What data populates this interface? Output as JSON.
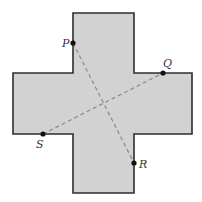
{
  "diagram": {
    "shape": "cross",
    "colors": {
      "fill": "#d2d2d2",
      "stroke": "#2e2e2e",
      "dash": "#8a8a8a",
      "point": "#111111",
      "label": "#333333"
    },
    "points": [
      {
        "name": "P",
        "x": 73,
        "y": 43,
        "label_x": 62,
        "label_y": 47
      },
      {
        "name": "Q",
        "x": 163,
        "y": 73,
        "label_x": 163,
        "label_y": 67
      },
      {
        "name": "R",
        "x": 134,
        "y": 163,
        "label_x": 139,
        "label_y": 168
      },
      {
        "name": "S",
        "x": 43,
        "y": 134,
        "label_x": 36,
        "label_y": 148
      }
    ],
    "segments": [
      {
        "from": "P",
        "to": "R"
      },
      {
        "from": "S",
        "to": "Q"
      }
    ]
  }
}
